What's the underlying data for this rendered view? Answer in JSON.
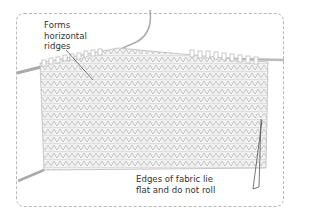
{
  "diagram": {
    "annotations": [
      {
        "id": "ridges",
        "lines": [
          "Forms",
          "horizontal",
          "ridges"
        ]
      },
      {
        "id": "edges",
        "lines": [
          "Edges of fabric lie",
          "flat and do not roll"
        ]
      }
    ],
    "colors": {
      "border": "#b8b8b8",
      "fabric": "#d0d0d0",
      "text": "#333333",
      "leader": "#555555"
    }
  }
}
